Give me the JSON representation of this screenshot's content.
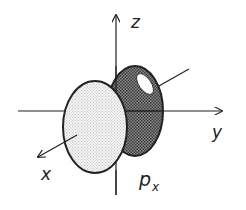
{
  "diagram": {
    "axes": {
      "z_label": "z",
      "y_label": "y",
      "x_label": "x"
    },
    "orbital_label": {
      "main": "p",
      "subscript": "x"
    },
    "colors": {
      "line": "#222222",
      "back_lobe": "#6a6a6a",
      "front_lobe": "#ececec",
      "highlight": "#ffffff"
    }
  }
}
